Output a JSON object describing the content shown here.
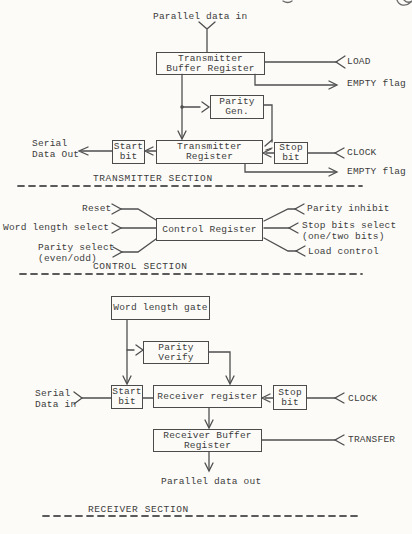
{
  "colors": {
    "ink": "#3d3d3d",
    "wire": "#4f4f4f",
    "dash": "#5a5a5a"
  },
  "transmitter_section": {
    "title": "TRANSMITTER SECTION",
    "boxes": {
      "buffer_register": "Transmitter\nBuffer Register",
      "parity_gen": "Parity\nGen.",
      "start_bit": "Start\nbit",
      "register": "Transmitter\nRegister",
      "stop_bit": "Stop\nbit"
    },
    "signals": {
      "parallel_data_in": "Parallel data in",
      "load": "LOAD",
      "empty_flag_top": "EMPTY flag",
      "serial_data_out": "Serial\nData Out",
      "clock": "CLOCK",
      "empty_flag_bottom": "EMPTY flag"
    }
  },
  "control_section": {
    "title": "CONTROL SECTION",
    "boxes": {
      "control_register": "Control Register"
    },
    "inputs": {
      "reset": "Reset",
      "word_length_select": "Word length select",
      "parity_select": "Parity select\n(even/odd)"
    },
    "outputs": {
      "parity_inhibit": "Parity inhibit",
      "stop_bits_select": "Stop bits select\n(one/two bits)",
      "load_control": "Load control"
    }
  },
  "receiver_section": {
    "title": "RECEIVER SECTION",
    "boxes": {
      "word_length_gate": "Word length gate",
      "parity_verify": "Parity\nVerify",
      "start_bit": "Start\nbit",
      "register": "Receiver register",
      "stop_bit": "Stop\nbit",
      "buffer_register": "Receiver Buffer\nRegister"
    },
    "signals": {
      "serial_data_in": "Serial\nData in",
      "clock": "CLOCK",
      "transfer": "TRANSFER",
      "parallel_data_out": "Parallel data out"
    }
  }
}
